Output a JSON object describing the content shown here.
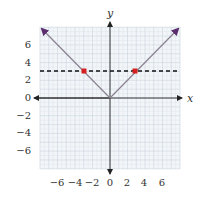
{
  "chart_data": {
    "type": "line",
    "title": "",
    "xlabel": "x",
    "ylabel": "y",
    "xlim": [
      -8,
      8
    ],
    "ylim": [
      -8,
      8
    ],
    "grid": true,
    "x_ticks": [
      -6,
      -4,
      -2,
      0,
      2,
      4,
      6
    ],
    "y_ticks": [
      -6,
      -4,
      -2,
      0,
      2,
      4,
      6
    ],
    "x_tick_labels": [
      "−6",
      "−4",
      "−2",
      "0",
      "2",
      "4",
      "6"
    ],
    "y_tick_labels": [
      "−6",
      "−4",
      "−2",
      "0",
      "2",
      "4",
      "6"
    ],
    "series": [
      {
        "name": "y = |x|",
        "style": "solid",
        "color": "#8a8190",
        "arrow_color": "#5a2d6e",
        "points": [
          [
            -8,
            8
          ],
          [
            0,
            0
          ],
          [
            8,
            8
          ]
        ]
      },
      {
        "name": "y = 3",
        "style": "dashed",
        "color": "#111111",
        "points": [
          [
            -8,
            3
          ],
          [
            8,
            3
          ]
        ]
      }
    ],
    "highlighted_points": [
      {
        "x": -3,
        "y": 3,
        "color": "#d42020"
      },
      {
        "x": 3,
        "y": 3,
        "color": "#d42020"
      }
    ],
    "legend": null
  },
  "labels": {
    "x_axis": "x",
    "y_axis": "y",
    "x_ticks": [
      "−6",
      "−4",
      "−2",
      "0",
      "2",
      "4",
      "6"
    ],
    "y_ticks": [
      "6",
      "4",
      "2",
      "0",
      "−2",
      "−4",
      "−6"
    ]
  }
}
